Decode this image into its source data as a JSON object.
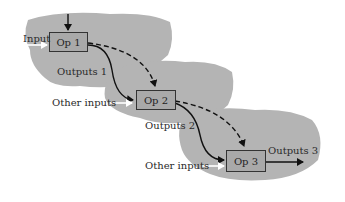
{
  "diagram": {
    "operations": [
      {
        "id": "op1",
        "label": "Op 1",
        "input_label": "Input",
        "output_label": "Outputs 1"
      },
      {
        "id": "op2",
        "label": "Op 2",
        "input_label": "Other inputs",
        "output_label": "Outputs 2"
      },
      {
        "id": "op3",
        "label": "Op 3",
        "input_label": "Other inputs",
        "output_label": "Outputs 3"
      }
    ],
    "colors": {
      "blob": "#b4b4b4",
      "box_fill": "#a9a9a9",
      "line": "#111111",
      "input_arrow": "#ffffff"
    },
    "edges": [
      {
        "from": "op1",
        "to": "op2",
        "style": "solid"
      },
      {
        "from": "op1",
        "to": "op2",
        "style": "dashed"
      },
      {
        "from": "op2",
        "to": "op3",
        "style": "solid"
      },
      {
        "from": "op2",
        "to": "op3",
        "style": "dashed"
      }
    ]
  }
}
